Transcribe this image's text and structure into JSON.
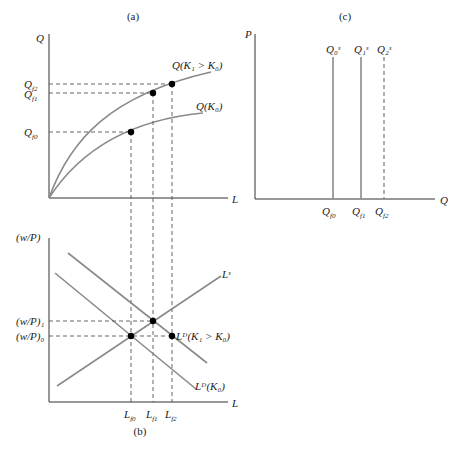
{
  "panels": {
    "a": {
      "title": "(a)",
      "y_axis": "Q",
      "x_axis": "L",
      "curve_high": "Q(K₁ > K₀)",
      "curve_low": "Q(K₀)",
      "ticks": [
        "Q_f2",
        "Q_f1",
        "Q_f0"
      ]
    },
    "b": {
      "title": "(b)",
      "y_axis": "(w/P)",
      "x_axis": "L",
      "supply": "Lˢ",
      "demand_high": "Lᴰ(K₁ > K₀)",
      "demand_low": "Lᴰ(K₀)",
      "y_ticks": [
        "(w/P)₁",
        "(w/P)₀"
      ],
      "x_ticks": [
        "L_f0",
        "L_f1",
        "L_f2"
      ]
    },
    "c": {
      "title": "(c)",
      "y_axis": "P",
      "x_axis": "Q",
      "supply_lines": [
        "Q₀ˢ",
        "Q₁ˢ",
        "Q₂ˢ"
      ],
      "x_ticks": [
        "Q_f0",
        "Q_f1",
        "Q_f2"
      ]
    }
  },
  "colors": {
    "curve": "#8a8a8a",
    "axis": "#333333",
    "dot": "#000000"
  }
}
